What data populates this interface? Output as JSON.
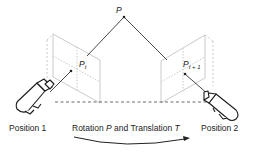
{
  "diagram": {
    "point_label": "P",
    "left_projection": {
      "base": "P",
      "subscript": "t"
    },
    "right_projection": {
      "base": "P",
      "subscript": "t + 1"
    },
    "camera_left_label": "Position 1",
    "camera_right_label": "Position 2",
    "motion_label": {
      "prefix": "Rotation ",
      "rotation_symbol": "P",
      "middle": " and Translation ",
      "translation_symbol": "T"
    },
    "colors": {
      "ray": "#333333",
      "plane": "#bbbbbb",
      "camera": "#1a1a1a",
      "baseline": "#444444"
    }
  }
}
